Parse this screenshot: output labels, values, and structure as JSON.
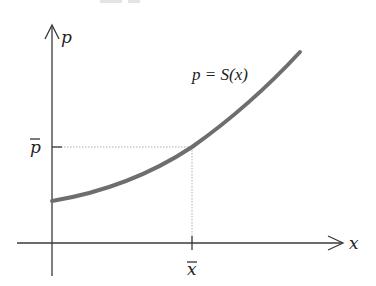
{
  "diagram": {
    "type": "supply-curve",
    "y_axis_label": "p",
    "x_axis_label": "x",
    "curve_label": "p = S(x)",
    "equilibrium_price_label": "p̄",
    "equilibrium_quantity_label": "x̄",
    "colors": {
      "axes": "#3a3a3a",
      "curve": "#6e6e6e",
      "guides": "#9a9a9a",
      "background": "#ffffff"
    },
    "geometry": {
      "origin": [
        52,
        243
      ],
      "y_axis_top": [
        52,
        25
      ],
      "x_axis_right": [
        343,
        243
      ],
      "curve_start": [
        52,
        201
      ],
      "equilibrium_point": [
        192,
        147
      ],
      "curve_end": [
        300,
        52
      ]
    }
  }
}
